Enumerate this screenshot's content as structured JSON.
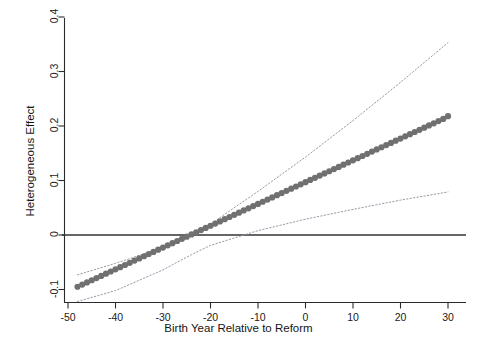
{
  "chart_data": {
    "type": "line",
    "title": "",
    "xlabel": "Birth Year Relative to Reform",
    "ylabel": "Heterogeneous Effect",
    "xlim": [
      -52,
      34
    ],
    "ylim": [
      -0.125,
      0.43
    ],
    "xticks": [
      -50,
      -40,
      -30,
      -20,
      -10,
      0,
      10,
      20,
      30
    ],
    "xtick_labels": [
      "-50",
      "-40",
      "-30",
      "-20",
      "-10",
      "0",
      "10",
      "20",
      "30"
    ],
    "yticks": [
      -0.1,
      0,
      0.1,
      0.2,
      0.3,
      0.4
    ],
    "ytick_labels": [
      "-0.1",
      "0",
      "0.1",
      "0.2",
      "0.3",
      "0.4"
    ],
    "grid": false,
    "legend": "none",
    "zero_line": {
      "y": 0,
      "style": "solid",
      "color": "#333333"
    },
    "series": [
      {
        "name": "Heterogeneous Effect",
        "style": "points-dense",
        "color": "#707070",
        "marker": "circle",
        "x": [
          -48,
          -47,
          -46,
          -45,
          -44,
          -43,
          -42,
          -41,
          -40,
          -39,
          -38,
          -37,
          -36,
          -35,
          -34,
          -33,
          -32,
          -31,
          -30,
          -29,
          -28,
          -27,
          -26,
          -25,
          -24,
          -23,
          -22,
          -21,
          -20,
          -19,
          -18,
          -17,
          -16,
          -15,
          -14,
          -13,
          -12,
          -11,
          -10,
          -9,
          -8,
          -7,
          -6,
          -5,
          -4,
          -3,
          -2,
          -1,
          0,
          1,
          2,
          3,
          4,
          5,
          6,
          7,
          8,
          9,
          10,
          11,
          12,
          13,
          14,
          15,
          16,
          17,
          18,
          19,
          20,
          21,
          22,
          23,
          24,
          25,
          26,
          27,
          28,
          29,
          30
        ],
        "y": [
          -0.095,
          -0.091,
          -0.087,
          -0.083,
          -0.079,
          -0.075,
          -0.071,
          -0.067,
          -0.063,
          -0.059,
          -0.055,
          -0.051,
          -0.047,
          -0.043,
          -0.039,
          -0.035,
          -0.031,
          -0.027,
          -0.023,
          -0.019,
          -0.015,
          -0.011,
          -0.007,
          -0.003,
          0.001,
          0.005,
          0.009,
          0.013,
          0.017,
          0.021,
          0.025,
          0.029,
          0.033,
          0.037,
          0.041,
          0.045,
          0.049,
          0.053,
          0.057,
          0.061,
          0.065,
          0.069,
          0.073,
          0.077,
          0.081,
          0.085,
          0.089,
          0.093,
          0.097,
          0.101,
          0.105,
          0.109,
          0.113,
          0.117,
          0.121,
          0.125,
          0.129,
          0.133,
          0.137,
          0.141,
          0.145,
          0.149,
          0.153,
          0.157,
          0.161,
          0.165,
          0.169,
          0.173,
          0.177,
          0.181,
          0.185,
          0.189,
          0.193,
          0.197,
          0.201,
          0.205,
          0.209,
          0.213,
          0.218
        ]
      },
      {
        "name": "Upper confidence bound",
        "style": "dotted",
        "color": "#9a9aa8",
        "x": [
          -48,
          -40,
          -30,
          -24,
          -20,
          -10,
          0,
          10,
          20,
          30
        ],
        "y": [
          -0.073,
          -0.052,
          -0.023,
          0.001,
          0.02,
          0.08,
          0.143,
          0.21,
          0.28,
          0.353
        ]
      },
      {
        "name": "Lower confidence bound",
        "style": "dotted",
        "color": "#9a9aa8",
        "x": [
          -48,
          -40,
          -30,
          -24,
          -20,
          -10,
          0,
          10,
          20,
          30
        ],
        "y": [
          -0.122,
          -0.102,
          -0.064,
          -0.036,
          -0.019,
          0.008,
          0.029,
          0.047,
          0.064,
          0.079
        ]
      }
    ]
  },
  "axes": {
    "x_title": "Birth Year Relative to Reform",
    "y_title": "Heterogeneous Effect"
  }
}
